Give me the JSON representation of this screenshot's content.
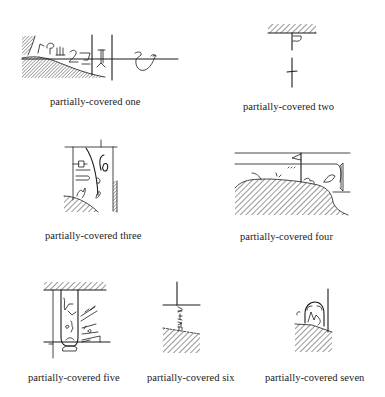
{
  "figure": {
    "panels": [
      {
        "id": "one",
        "caption": "partially-covered one",
        "content": "horizontal sign line with hatched mound at left covering glyph row; vertical divider lines; bird glyph on right"
      },
      {
        "id": "two",
        "caption": "partially-covered two",
        "content": "hatched ceiling band; vertical stroke with small hook glyph below; cross-stroke sign"
      },
      {
        "id": "three",
        "caption": "partially-covered three",
        "content": "column frame with cartouche-like glyphs; hatched mound bottom-left; hatched wall right"
      },
      {
        "id": "four",
        "caption": "partially-covered four",
        "content": "two horizontal lines with flag glyph; large hatched mound covering lower half; leaf glyph at right"
      },
      {
        "id": "five",
        "caption": "partially-covered five",
        "content": "hatched ceiling band; vertical cartouche column with glyphs; slanted glyph strokes at right"
      },
      {
        "id": "six",
        "caption": "partially-covered six",
        "content": "vertical line meeting horizontal bar; small vertical glyph text; hatched slope below"
      },
      {
        "id": "seven",
        "caption": "partially-covered seven",
        "content": "vertical line; small arched glyph; hatched slope below"
      }
    ]
  },
  "colors": {
    "ink": "#1a1a1a",
    "paper": "#ffffff"
  }
}
